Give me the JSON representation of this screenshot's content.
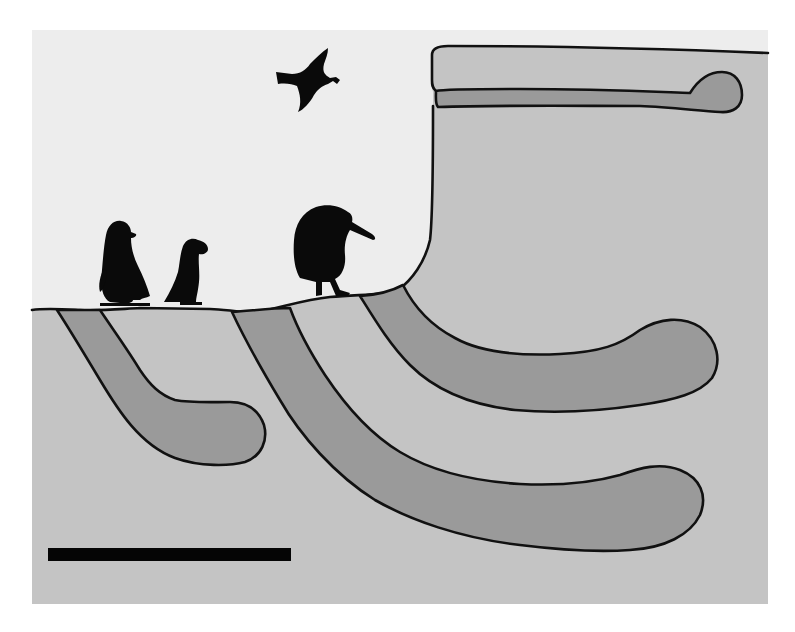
{
  "figure": {
    "type": "cross-section diagram",
    "colors": {
      "sky": "#ededed",
      "soil": "#c4c4c4",
      "burrow": "#9a9a9a",
      "outline": "#111111",
      "silhouette": "#0a0a0a",
      "page_background": "#ffffff"
    },
    "birds": [
      {
        "id": "penguin",
        "label": "Penguin silhouette",
        "position": "standing on ground, left"
      },
      {
        "id": "puffin",
        "label": "Puffin silhouette",
        "position": "standing on ground, left-center"
      },
      {
        "id": "kiwi",
        "label": "Kiwi silhouette",
        "position": "standing on ground, center"
      },
      {
        "id": "flying-bird",
        "label": "Flying bird carrying nesting material",
        "position": "sky, upper center"
      }
    ],
    "burrows": [
      {
        "id": "burrow-1",
        "label": "Short shallow burrow",
        "entrance": "ground surface, far left"
      },
      {
        "id": "burrow-2",
        "label": "Long deep burrow",
        "entrance": "ground surface, center"
      },
      {
        "id": "burrow-3",
        "label": "Medium burrow",
        "entrance": "base of cliff"
      },
      {
        "id": "burrow-4",
        "label": "Horizontal cliff-top burrow",
        "entrance": "cliff face, top"
      }
    ],
    "scale_bar": {
      "label": "",
      "visible": true
    }
  },
  "caption": "Cross-section of bird burrows: penguin, puffin, kiwi and flying seabird with burrows in soil and cliff"
}
